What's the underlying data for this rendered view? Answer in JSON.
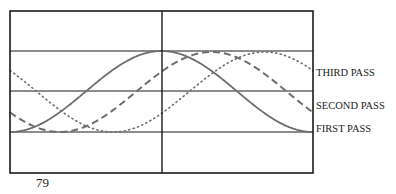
{
  "figure": {
    "box": {
      "left": 10,
      "top": 11,
      "right": 313,
      "bottom": 173,
      "divider_x": 162
    },
    "gridlines_y": [
      51,
      91,
      132
    ],
    "labels": [
      {
        "id": "third",
        "text": "THIRD PASS",
        "x": 316,
        "y": 73
      },
      {
        "id": "second",
        "text": "SECOND PASS",
        "x": 316,
        "y": 106
      },
      {
        "id": "first",
        "text": "FIRST PASS",
        "x": 316,
        "y": 129
      }
    ],
    "page_number": "79",
    "colors": {
      "frame": "#1a1a1a",
      "curve": "#6e6e6e"
    }
  },
  "chart_data": {
    "type": "line",
    "title": "",
    "xlabel": "",
    "ylabel": "",
    "series": [
      {
        "name": "FIRST PASS",
        "style": "solid",
        "shape": "cosine",
        "trough_x": 10,
        "peak_x": 162,
        "min_y": 132,
        "max_y": 51
      },
      {
        "name": "SECOND PASS",
        "style": "dashed",
        "shape": "cosine",
        "phase_shift_px": 50,
        "min_y": 132,
        "max_y": 52
      },
      {
        "name": "THIRD PASS",
        "style": "dotted",
        "shape": "cosine",
        "phase_shift_px": 103,
        "min_y": 132,
        "max_y": 52
      }
    ],
    "grid": true,
    "legend_position": "right"
  }
}
